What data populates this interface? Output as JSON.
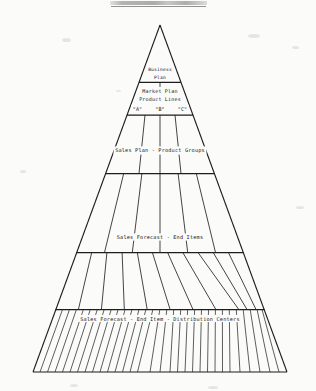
{
  "document": {
    "title_bar_label": "",
    "figure_caption": ""
  },
  "diagram": {
    "name": "planning-hierarchy-pyramid",
    "shape": "triangle",
    "ink_color": "#1d1d1d",
    "paper_color": "#fbfbfa",
    "tiers": [
      {
        "index": 1,
        "label": "Business Plan",
        "label_lines": [
          "Business",
          "Plan"
        ],
        "segments": 1
      },
      {
        "index": 2,
        "label": "Market Plan Product Lines",
        "label_lines": [
          "Market Plan",
          "Product Lines"
        ],
        "segments": 1
      },
      {
        "index": 3,
        "label": "",
        "label_lines": [],
        "segments": 3,
        "segment_labels": [
          "\"A\"",
          "\"B\"",
          "\"C\""
        ]
      },
      {
        "index": 4,
        "label": "Sales Plan - Product Groups",
        "label_lines": [
          "Sales Plan - Product Groups"
        ],
        "segments": 6
      },
      {
        "index": 5,
        "label": "Sales Forecast - End Items",
        "label_lines": [
          "Sales Forecast - End Items"
        ],
        "segments": 11
      },
      {
        "index": 6,
        "label": "Sales Forecast - End Item - Distribution Centers",
        "label_lines": [
          "Sales Forecast - End Item - Distribution Centers"
        ],
        "segments": 30
      }
    ]
  }
}
